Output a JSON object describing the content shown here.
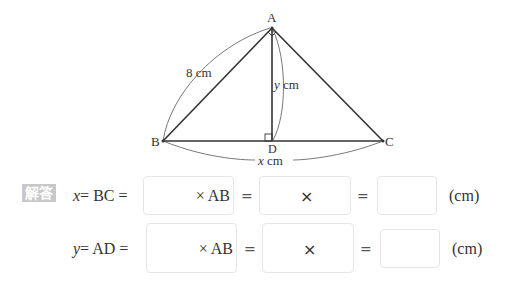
{
  "figure": {
    "vertices": {
      "A": "A",
      "B": "B",
      "C": "C",
      "D": "D"
    },
    "labels": {
      "ab_length": "8 cm",
      "ad_var": "y",
      "ad_unit": " cm",
      "bc_var": "x",
      "bc_unit": " cm"
    },
    "marks": [
      "right-angle-at-A",
      "right-angle-at-D"
    ],
    "colors": {
      "line": "#333333",
      "badge": "#c8c8c8"
    }
  },
  "answer": {
    "badge": "解答",
    "rows": [
      {
        "var": "x",
        "lhs": "= BC =",
        "box1_suffix": "× AB",
        "eq1": "=",
        "box2_text": "×",
        "eq2": "=",
        "unit": "(cm)"
      },
      {
        "var": "y",
        "lhs": "= AD =",
        "box1_suffix": "× AB",
        "eq1": "=",
        "box2_text": "×",
        "eq2": "=",
        "unit": "(cm)"
      }
    ]
  }
}
